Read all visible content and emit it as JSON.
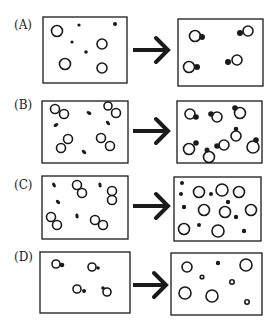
{
  "figure": {
    "stroke_color": "#1a1a1a",
    "background": "#ffffff",
    "rows": [
      {
        "label": "(A)",
        "label_pos": [
          14,
          24
        ],
        "left_box": [
          43,
          17,
          84,
          66
        ],
        "right_box": [
          178,
          19,
          85,
          67
        ],
        "arrow": [
          133,
          50,
          168,
          50
        ],
        "left_items": [
          {
            "type": "ring",
            "cx": 57,
            "cy": 31,
            "r": 5.5
          },
          {
            "type": "dot",
            "cx": 79,
            "cy": 25,
            "r": 1.6
          },
          {
            "type": "dot",
            "cx": 115,
            "cy": 24,
            "r": 2
          },
          {
            "type": "dot",
            "cx": 72,
            "cy": 42,
            "r": 1.6
          },
          {
            "type": "ring",
            "cx": 102,
            "cy": 44,
            "r": 5
          },
          {
            "type": "dot",
            "cx": 86,
            "cy": 52,
            "r": 1.8
          },
          {
            "type": "ring",
            "cx": 65,
            "cy": 64,
            "r": 5.5
          },
          {
            "type": "ring",
            "cx": 102,
            "cy": 68,
            "r": 5
          }
        ],
        "right_items": [
          {
            "type": "ring",
            "cx": 195,
            "cy": 36,
            "r": 5.5
          },
          {
            "type": "dot",
            "cx": 202,
            "cy": 37,
            "r": 3
          },
          {
            "type": "ring",
            "cx": 248,
            "cy": 31,
            "r": 5
          },
          {
            "type": "dot",
            "cx": 240,
            "cy": 33,
            "r": 3
          },
          {
            "type": "ring",
            "cx": 189,
            "cy": 67,
            "r": 5.5
          },
          {
            "type": "dot",
            "cx": 197,
            "cy": 67,
            "r": 3
          },
          {
            "type": "ring",
            "cx": 237,
            "cy": 60,
            "r": 5
          },
          {
            "type": "dot",
            "cx": 228,
            "cy": 62,
            "r": 3
          }
        ]
      },
      {
        "label": "(B)",
        "label_pos": [
          14,
          104
        ],
        "left_box": [
          42,
          101,
          86,
          62
        ],
        "right_box": [
          177,
          101,
          85,
          62
        ],
        "arrow": [
          133,
          131,
          168,
          131
        ],
        "left_items": [
          {
            "type": "ring",
            "cx": 55,
            "cy": 109,
            "r": 4.5
          },
          {
            "type": "ring",
            "cx": 64,
            "cy": 114,
            "r": 4.5
          },
          {
            "type": "bar",
            "cx": 89,
            "cy": 113,
            "r": 2,
            "angle": 30
          },
          {
            "type": "ring",
            "cx": 108,
            "cy": 106,
            "r": 4
          },
          {
            "type": "ring",
            "cx": 116,
            "cy": 113,
            "r": 4.5
          },
          {
            "type": "bar",
            "cx": 56,
            "cy": 125,
            "r": 2,
            "angle": -30
          },
          {
            "type": "bar",
            "cx": 108,
            "cy": 123,
            "r": 2,
            "angle": 50
          },
          {
            "type": "ring",
            "cx": 68,
            "cy": 139,
            "r": 4.5
          },
          {
            "type": "ring",
            "cx": 61,
            "cy": 148,
            "r": 4.5
          },
          {
            "type": "ring",
            "cx": 101,
            "cy": 138,
            "r": 4.5
          },
          {
            "type": "ring",
            "cx": 110,
            "cy": 146,
            "r": 4.5
          },
          {
            "type": "bar",
            "cx": 84,
            "cy": 152,
            "r": 2,
            "angle": 40
          }
        ],
        "right_items": [
          {
            "type": "ring",
            "cx": 190,
            "cy": 114,
            "r": 5
          },
          {
            "type": "dot",
            "cx": 196,
            "cy": 117,
            "r": 2.8
          },
          {
            "type": "ring",
            "cx": 217,
            "cy": 117,
            "r": 5
          },
          {
            "type": "dot",
            "cx": 211,
            "cy": 114,
            "r": 2.8
          },
          {
            "type": "ring",
            "cx": 240,
            "cy": 113,
            "r": 5.5
          },
          {
            "type": "dot",
            "cx": 235,
            "cy": 108,
            "r": 2.8
          },
          {
            "type": "ring",
            "cx": 189,
            "cy": 149,
            "r": 5.5
          },
          {
            "type": "dot",
            "cx": 196,
            "cy": 143,
            "r": 2.8
          },
          {
            "type": "ring",
            "cx": 209,
            "cy": 157,
            "r": 5.5
          },
          {
            "type": "dot",
            "cx": 207,
            "cy": 150,
            "r": 2.5
          },
          {
            "type": "ring",
            "cx": 224,
            "cy": 145,
            "r": 5
          },
          {
            "type": "dot",
            "cx": 217,
            "cy": 146,
            "r": 2.8
          },
          {
            "type": "ring",
            "cx": 236,
            "cy": 136,
            "r": 5
          },
          {
            "type": "dot",
            "cx": 236,
            "cy": 129,
            "r": 2.3
          },
          {
            "type": "ring",
            "cx": 253,
            "cy": 147,
            "r": 6
          },
          {
            "type": "dot",
            "cx": 256,
            "cy": 140,
            "r": 2.8
          }
        ]
      },
      {
        "label": "(C)",
        "label_pos": [
          14,
          184
        ],
        "left_box": [
          42,
          176,
          86,
          63
        ],
        "right_box": [
          174,
          177,
          87,
          64
        ],
        "arrow": [
          133,
          206,
          168,
          206
        ],
        "left_items": [
          {
            "type": "bar",
            "cx": 54,
            "cy": 185,
            "r": 2,
            "angle": 60
          },
          {
            "type": "ring",
            "cx": 77,
            "cy": 185,
            "r": 4.5
          },
          {
            "type": "ring",
            "cx": 82,
            "cy": 193,
            "r": 4.5
          },
          {
            "type": "bar",
            "cx": 100,
            "cy": 185,
            "r": 2,
            "angle": 80
          },
          {
            "type": "ring",
            "cx": 112,
            "cy": 191,
            "r": 4.5
          },
          {
            "type": "ring",
            "cx": 112,
            "cy": 200,
            "r": 4.5
          },
          {
            "type": "bar",
            "cx": 58,
            "cy": 202,
            "r": 2,
            "angle": 45
          },
          {
            "type": "ring",
            "cx": 51,
            "cy": 217,
            "r": 4.5
          },
          {
            "type": "ring",
            "cx": 57,
            "cy": 225,
            "r": 4.5
          },
          {
            "type": "bar",
            "cx": 77,
            "cy": 216,
            "r": 2,
            "angle": 80
          },
          {
            "type": "ring",
            "cx": 95,
            "cy": 220,
            "r": 4.5
          },
          {
            "type": "ring",
            "cx": 103,
            "cy": 225,
            "r": 4.5
          }
        ],
        "right_items": [
          {
            "type": "dot",
            "cx": 182,
            "cy": 183,
            "r": 2
          },
          {
            "type": "dot",
            "cx": 181,
            "cy": 194,
            "r": 2
          },
          {
            "type": "ring",
            "cx": 199,
            "cy": 192,
            "r": 5.5
          },
          {
            "type": "dot",
            "cx": 211,
            "cy": 194,
            "r": 2
          },
          {
            "type": "ring",
            "cx": 222,
            "cy": 190,
            "r": 6
          },
          {
            "type": "ring",
            "cx": 239,
            "cy": 192,
            "r": 5.5
          },
          {
            "type": "dot",
            "cx": 228,
            "cy": 202,
            "r": 2.2
          },
          {
            "type": "dot",
            "cx": 184,
            "cy": 207,
            "r": 2.2
          },
          {
            "type": "ring",
            "cx": 204,
            "cy": 210,
            "r": 5.5
          },
          {
            "type": "ring",
            "cx": 225,
            "cy": 212,
            "r": 5.5
          },
          {
            "type": "dot",
            "cx": 236,
            "cy": 217,
            "r": 2.2
          },
          {
            "type": "ring",
            "cx": 251,
            "cy": 210,
            "r": 5.5
          },
          {
            "type": "ring",
            "cx": 184,
            "cy": 229,
            "r": 5.5
          },
          {
            "type": "dot",
            "cx": 199,
            "cy": 225,
            "r": 2
          },
          {
            "type": "ring",
            "cx": 218,
            "cy": 231,
            "r": 6
          },
          {
            "type": "dot",
            "cx": 244,
            "cy": 231,
            "r": 2.2
          }
        ]
      },
      {
        "label": "(D)",
        "label_pos": [
          14,
          256
        ],
        "left_box": [
          40,
          252,
          90,
          61
        ],
        "right_box": [
          171,
          253,
          91,
          62
        ],
        "arrow": [
          133,
          285,
          166,
          285
        ],
        "left_items": [
          {
            "type": "ring",
            "cx": 56,
            "cy": 264,
            "r": 4
          },
          {
            "type": "dot",
            "cx": 62,
            "cy": 265,
            "r": 2.3
          },
          {
            "type": "ring",
            "cx": 92,
            "cy": 267,
            "r": 4
          },
          {
            "type": "dot",
            "cx": 98,
            "cy": 268,
            "r": 1.8
          },
          {
            "type": "ring",
            "cx": 77,
            "cy": 289,
            "r": 4
          },
          {
            "type": "dot",
            "cx": 84,
            "cy": 291,
            "r": 2
          },
          {
            "type": "ring",
            "cx": 107,
            "cy": 292,
            "r": 4
          },
          {
            "type": "dot",
            "cx": 103,
            "cy": 288,
            "r": 1.8
          }
        ],
        "right_items": [
          {
            "type": "ring",
            "cx": 187,
            "cy": 267,
            "r": 5
          },
          {
            "type": "dot",
            "cx": 218,
            "cy": 263,
            "r": 2.2
          },
          {
            "type": "ring",
            "cx": 246,
            "cy": 265,
            "r": 6
          },
          {
            "type": "ring",
            "cx": 202,
            "cy": 277,
            "r": 1.8
          },
          {
            "type": "ring",
            "cx": 232,
            "cy": 282,
            "r": 2.2
          },
          {
            "type": "ring",
            "cx": 185,
            "cy": 293,
            "r": 6
          },
          {
            "type": "ring",
            "cx": 212,
            "cy": 296,
            "r": 6
          },
          {
            "type": "ring",
            "cx": 247,
            "cy": 302,
            "r": 2.2
          }
        ]
      }
    ]
  }
}
